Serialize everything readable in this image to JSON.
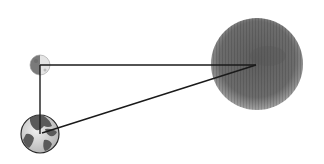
{
  "diagram": {
    "type": "earth-moon-sun-triangle",
    "bodies": [
      {
        "name": "moon",
        "cx": 40,
        "cy": 65,
        "r": 10,
        "phase": "half-lit (right side lit)"
      },
      {
        "name": "earth",
        "cx": 40,
        "cy": 134,
        "r": 19
      },
      {
        "name": "sun",
        "cx": 257,
        "cy": 64,
        "r": 46
      }
    ],
    "lines": [
      {
        "from": "moon",
        "to": "sun",
        "x1": 40,
        "y1": 65,
        "x2": 256,
        "y2": 65
      },
      {
        "from": "moon",
        "to": "earth",
        "x1": 40,
        "y1": 65,
        "x2": 40,
        "y2": 134
      },
      {
        "from": "earth",
        "to": "sun",
        "x1": 42,
        "y1": 133,
        "x2": 256,
        "y2": 65
      }
    ],
    "colors": {
      "background": "#ffffff",
      "line": "#1a1a1a",
      "sun_fill": "#6a6a6a",
      "sun_edge": "#9a9a9a",
      "moon_dark": "#7a7a7a",
      "moon_lit": "#e4e4e4",
      "earth_ocean": "#d6d6d6",
      "earth_land": "#5a5a5a"
    }
  }
}
